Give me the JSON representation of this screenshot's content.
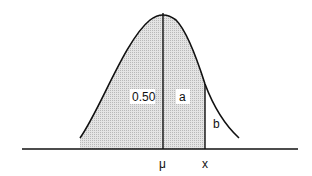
{
  "diagram": {
    "type": "normal-distribution-curve",
    "labels": {
      "left_area": "0.50",
      "middle_area": "a",
      "right_tail": "b",
      "mean": "μ",
      "x_value": "x"
    },
    "colors": {
      "line": "#111111",
      "shade": "#d8d8d8",
      "background": "#ffffff"
    }
  }
}
